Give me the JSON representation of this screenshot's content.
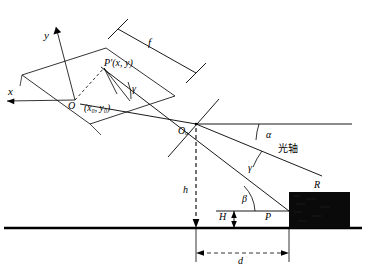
{
  "figure": {
    "stroke_color": "#000000",
    "background_color": "#ffffff",
    "target_fill": "#0a0a0a"
  },
  "labels": {
    "axis_x": "x",
    "axis_y": "y",
    "origin_O": "O",
    "image_point": "P'(x, y)",
    "principal_point": "(x₀, y₀)",
    "lens_center": "Oₒ",
    "focal_length": "f",
    "gamma_image": "γ",
    "alpha": "α",
    "gamma_object": "γ",
    "beta": "β",
    "optical_axis": "光轴",
    "height_h": "h",
    "height_H": "H",
    "target_point": "P",
    "target_R": "R",
    "distance_d": "d"
  },
  "geometry": {
    "lens_center_xy": [
      196,
      124
    ],
    "ground_line_y": 228,
    "target_rect": [
      289,
      192,
      61,
      36
    ],
    "image_plane_origin": [
      75,
      100
    ],
    "image_point_xy": [
      118,
      75
    ]
  }
}
